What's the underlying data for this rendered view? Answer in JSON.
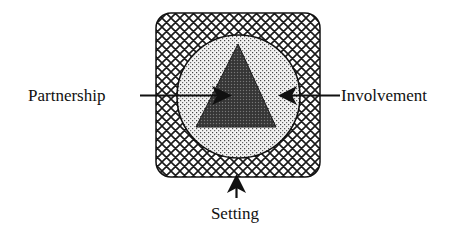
{
  "diagram": {
    "type": "nested-concept-diagram",
    "layers": [
      {
        "name": "Setting",
        "shape": "rounded-square",
        "fill": "crosshatch",
        "color": "#1a1a1a"
      },
      {
        "name": "Involvement",
        "shape": "circle",
        "fill": "stipple",
        "color": "#555555"
      },
      {
        "name": "Partnership",
        "shape": "triangle",
        "fill": "dark-dense-dots",
        "color": "#2a2a2a"
      }
    ],
    "labels": {
      "partnership": "Partnership",
      "involvement": "Involvement",
      "setting": "Setting"
    },
    "arrows": [
      {
        "from": "Partnership",
        "direction": "right",
        "points_to": "triangle"
      },
      {
        "from": "Involvement",
        "direction": "left",
        "points_to": "circle"
      },
      {
        "from": "Setting",
        "direction": "up",
        "points_to": "square"
      }
    ],
    "colors": {
      "stroke": "#111111",
      "background": "#ffffff",
      "triangle_fill": "#3a3a3a",
      "circle_fill": "#e8e8e8"
    }
  }
}
